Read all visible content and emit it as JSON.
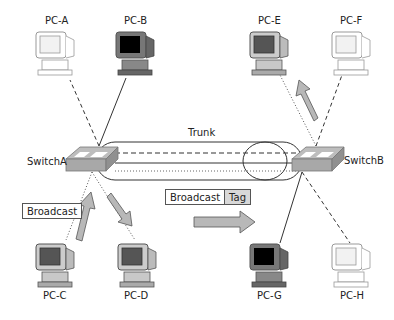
{
  "diagram": {
    "switches": [
      {
        "id": "switchA",
        "label": "SwitchA"
      },
      {
        "id": "switchB",
        "label": "SwitchB"
      }
    ],
    "pcs": [
      {
        "id": "pc-a",
        "label": "PC-A",
        "vlan_style": "dashed",
        "screen": "white"
      },
      {
        "id": "pc-b",
        "label": "PC-B",
        "vlan_style": "solid",
        "screen": "black"
      },
      {
        "id": "pc-c",
        "label": "PC-C",
        "vlan_style": "dotted",
        "screen": "gray"
      },
      {
        "id": "pc-d",
        "label": "PC-D",
        "vlan_style": "dotted",
        "screen": "gray"
      },
      {
        "id": "pc-e",
        "label": "PC-E",
        "vlan_style": "dotted",
        "screen": "gray"
      },
      {
        "id": "pc-f",
        "label": "PC-F",
        "vlan_style": "dashed",
        "screen": "white"
      },
      {
        "id": "pc-g",
        "label": "PC-G",
        "vlan_style": "solid",
        "screen": "black"
      },
      {
        "id": "pc-h",
        "label": "PC-H",
        "vlan_style": "dashed",
        "screen": "white"
      }
    ],
    "trunk": {
      "label": "Trunk",
      "lines": [
        "dashed",
        "solid",
        "dotted"
      ]
    },
    "frames": {
      "untagged": {
        "label": "Broadcast"
      },
      "tagged": {
        "payload": "Broadcast",
        "tag": "Tag"
      }
    },
    "colors": {
      "arrow_fill": "#b8b8b8",
      "switch_fill": "#a8a8a8",
      "tag_fill": "#d8d8d8"
    }
  }
}
